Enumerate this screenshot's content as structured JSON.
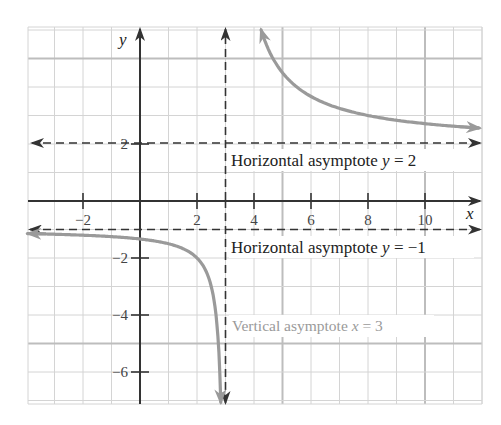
{
  "chart_data": {
    "type": "line",
    "title": "",
    "xlabel": "x",
    "ylabel": "y",
    "xlim": [
      -3.93,
      12
    ],
    "ylim": [
      -7.1,
      6.1
    ],
    "grid": true,
    "x_ticks": [
      -2,
      2,
      4,
      6,
      8,
      10
    ],
    "x_tick_labels": [
      "−2",
      "2",
      "4",
      "6",
      "8",
      "10"
    ],
    "y_ticks": [
      2,
      -2,
      -4,
      -6
    ],
    "y_tick_labels": [
      "2",
      "−2",
      "−4",
      "−6"
    ],
    "series": [
      {
        "name": "upper branch",
        "description": "y = 2 + 5/(x - 3), x > 3",
        "color": "#9a9a9a",
        "points": [
          [
            4.3,
            5.85
          ],
          [
            5,
            4.5
          ],
          [
            6,
            3.67
          ],
          [
            7,
            3.25
          ],
          [
            8,
            3.0
          ],
          [
            9,
            2.83
          ],
          [
            10,
            2.71
          ],
          [
            11,
            2.63
          ],
          [
            11.86,
            2.56
          ]
        ]
      },
      {
        "name": "lower branch",
        "description": "y = -1 - 1/(3 - x), x < 3",
        "color": "#9a9a9a",
        "points": [
          [
            -3.9,
            -1.14
          ],
          [
            -2,
            -1.2
          ],
          [
            0,
            -1.33
          ],
          [
            1,
            -1.5
          ],
          [
            2,
            -2.0
          ],
          [
            2.5,
            -3.0
          ],
          [
            2.75,
            -5.0
          ],
          [
            2.84,
            -7.0
          ]
        ]
      }
    ],
    "asymptotes": [
      {
        "type": "horizontal",
        "value": 2,
        "label_prefix": "Horizontal asymptote ",
        "label_var": "y",
        "label_suffix": " = 2"
      },
      {
        "type": "horizontal",
        "value": -1,
        "label_prefix": "Horizontal asymptote ",
        "label_var": "y",
        "label_suffix": " = −1"
      },
      {
        "type": "vertical",
        "value": 3,
        "label_prefix": "Vertical asymptote ",
        "label_var": "x",
        "label_suffix": " = 3"
      }
    ]
  },
  "labels": {
    "x_axis": "x",
    "y_axis": "y",
    "h_asym_2": {
      "prefix": "Horizontal asymptote ",
      "var": "y",
      "suffix": " = 2"
    },
    "h_asym_neg1": {
      "prefix": "Horizontal asymptote ",
      "var": "y",
      "suffix": " = −1"
    },
    "v_asym_3": {
      "prefix": "Vertical asymptote ",
      "var": "x",
      "suffix": " = 3"
    },
    "ticks_x": [
      "−2",
      "2",
      "4",
      "6",
      "8",
      "10"
    ],
    "ticks_y": [
      "2",
      "−2",
      "−4",
      "−6"
    ]
  },
  "colors": {
    "curve": "#9a9a9a",
    "axis": "#333333",
    "grid": "#d4d4d4",
    "grid_major": "#bdbdbd",
    "asymptote": "#333333",
    "vertical_label": "#9a9a9a",
    "text": "#222222"
  }
}
